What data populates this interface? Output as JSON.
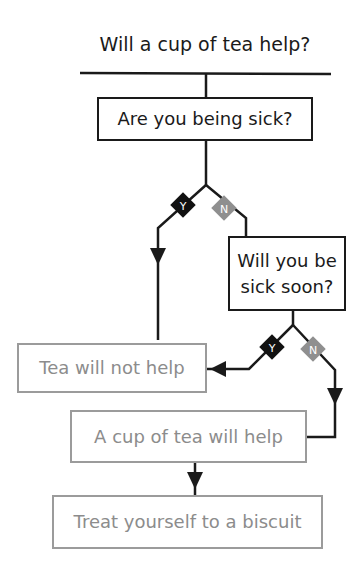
{
  "title": "Will a cup of tea help?",
  "nodes": {
    "q1": {
      "label": "Are you being sick?",
      "style": "dark"
    },
    "q2": {
      "label_line1": "Will you be",
      "label_line2": "sick soon?",
      "style": "dark"
    },
    "tea_no": {
      "label": "Tea will not help",
      "style": "light"
    },
    "tea_yes": {
      "label": "A cup of tea will help",
      "style": "light"
    },
    "biscuit": {
      "label": "Treat yourself to a biscuit",
      "style": "light"
    }
  },
  "branches": {
    "q1_yes": "Y",
    "q1_no": "N",
    "q2_yes": "Y",
    "q2_no": "N"
  },
  "edges": [
    {
      "from": "title",
      "to": "q1"
    },
    {
      "from": "q1",
      "to": "tea_no",
      "label": "Y"
    },
    {
      "from": "q1",
      "to": "q2",
      "label": "N"
    },
    {
      "from": "q2",
      "to": "tea_no",
      "label": "Y"
    },
    {
      "from": "q2",
      "to": "tea_yes",
      "label": "N"
    },
    {
      "from": "tea_yes",
      "to": "biscuit"
    }
  ],
  "colors": {
    "dark": "#1a1a1a",
    "light": "#9b9b9b",
    "yes_diamond": "#111111",
    "no_diamond": "#8f8f8f"
  }
}
